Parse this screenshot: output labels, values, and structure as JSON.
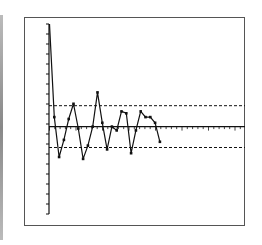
{
  "chart_data": {
    "type": "line",
    "title": "",
    "xlabel": "",
    "ylabel": "",
    "grid": false,
    "legend": null,
    "ylim": [
      0,
      100
    ],
    "y_tick_count": 19,
    "x_tick_count": 37,
    "center_line": 46,
    "upper_control_limit": 57,
    "lower_control_limit": 35,
    "x": [
      0,
      1,
      2,
      3,
      4,
      5,
      6,
      7,
      8,
      9,
      10,
      11,
      12,
      13,
      14,
      15,
      16,
      17,
      18,
      19,
      20,
      21,
      22,
      23
    ],
    "series": [
      {
        "name": "measurements",
        "values": [
          100,
          51,
          30,
          39,
          50,
          58,
          45,
          29,
          36,
          46,
          64,
          48,
          34,
          46,
          44,
          54,
          53,
          32,
          44,
          54,
          51,
          51,
          48,
          38
        ]
      }
    ]
  },
  "colors": {
    "line": "#111111",
    "frame": "#555555",
    "background": "#ffffff"
  }
}
